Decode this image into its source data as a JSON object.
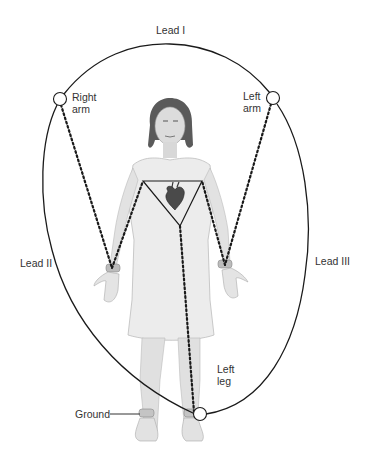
{
  "diagram": {
    "labels": {
      "lead_i": "Lead I",
      "lead_ii": "Lead II",
      "lead_iii": "Lead III",
      "right_arm_line1": "Right",
      "right_arm_line2": "arm",
      "left_arm_line1": "Left",
      "left_arm_line2": "arm",
      "left_leg_line1": "Left",
      "left_leg_line2": "leg",
      "ground": "Ground"
    },
    "electrodes": [
      {
        "name": "right-arm",
        "x": 60,
        "y": 99
      },
      {
        "name": "left-arm",
        "x": 273,
        "y": 98
      },
      {
        "name": "left-leg",
        "x": 200,
        "y": 414
      }
    ],
    "colors": {
      "line": "#1a1a1a",
      "label": "#333333",
      "figure": "#e6e6e6",
      "heart": "#4a4a4a"
    }
  }
}
